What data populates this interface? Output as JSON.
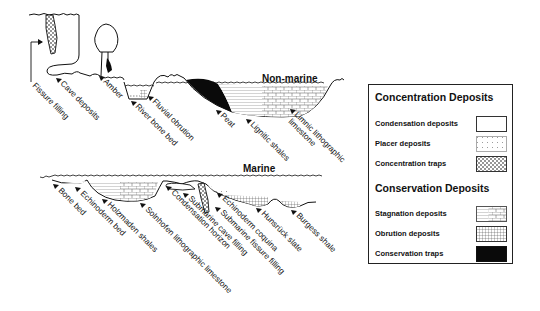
{
  "diagram": {
    "sections": {
      "non_marine": "Non-marine",
      "marine": "Marine"
    },
    "non_marine_labels": [
      "Fissure filling",
      "Cave deposits",
      "Amber",
      "River bone bed",
      "Fluvial obrution",
      "Peat",
      "Lignitic shales",
      "Limnic lithographic",
      "limestone"
    ],
    "marine_labels": [
      "Bone bed",
      "Echinoderm bed",
      "Holzmaden shales",
      "Solnhofen lithographic limestone",
      "Condensation horizon",
      "Submarine cave filling",
      "Submarine fissure filling",
      "Echinoderm coquina",
      "Hunsrück slate",
      "Burgess shale"
    ]
  },
  "legend": {
    "groups": [
      {
        "title": "Concentration Deposits",
        "items": [
          {
            "label": "Condensation deposits",
            "pattern": "blank"
          },
          {
            "label": "Placer deposits",
            "pattern": "sparse-dots"
          },
          {
            "label": "Concentration traps",
            "pattern": "dense-dots"
          }
        ]
      },
      {
        "title": "Conservation Deposits",
        "items": [
          {
            "label": "Stagnation deposits",
            "pattern": "brick-and-lines"
          },
          {
            "label": "Obrution deposits",
            "pattern": "grid"
          },
          {
            "label": "Conservation traps",
            "pattern": "solid-black"
          }
        ]
      }
    ]
  },
  "colors": {
    "ink": "#111111",
    "background": "#ffffff",
    "fill_black": "#0a0a0a"
  }
}
